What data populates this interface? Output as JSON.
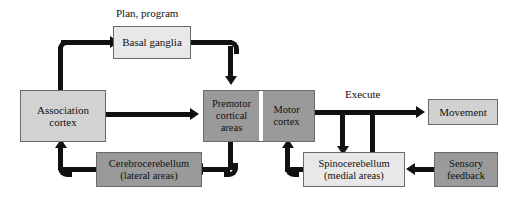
{
  "diagram": {
    "colors": {
      "light_fill": "#e8e8e8",
      "mid_fill": "#d2d2d2",
      "dark_fill": "#9a9a9a",
      "border": "#6b6b6b",
      "connector": "#111111",
      "background": "#ffffff"
    },
    "labels": {
      "plan_program": "Plan, program",
      "execute": "Execute"
    },
    "nodes": {
      "basal_ganglia": "Basal ganglia",
      "association_cortex_line1": "Association",
      "association_cortex_line2": "cortex",
      "premotor_line1": "Premotor",
      "premotor_line2": "cortical",
      "premotor_line3": "areas",
      "motor_cortex_line1": "Motor",
      "motor_cortex_line2": "cortex",
      "movement": "Movement",
      "cerebrocerebellum_line1": "Cerebrocerebellum",
      "cerebrocerebellum_line2": "(lateral areas)",
      "spinocerebellum_line1": "Spinocerebellum",
      "spinocerebellum_line2": "(medial areas)",
      "sensory_feedback_line1": "Sensory",
      "sensory_feedback_line2": "feedback"
    }
  }
}
